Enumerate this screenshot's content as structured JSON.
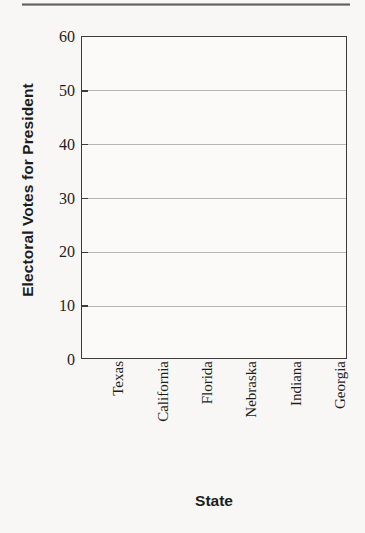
{
  "chart_data": {
    "type": "bar",
    "title": "",
    "subtitle": "",
    "xlabel": "State",
    "ylabel": "Electoral Votes for President",
    "categories": [
      "Texas",
      "California",
      "Florida",
      "Nebraska",
      "Indiana",
      "Georgia"
    ],
    "values": [
      null,
      null,
      null,
      null,
      null,
      null
    ],
    "series": [
      {
        "name": "Electoral Votes for President",
        "values": [
          null,
          null,
          null,
          null,
          null,
          null
        ]
      }
    ],
    "ylim": [
      0,
      60
    ],
    "ytick_labels": [
      "0",
      "10",
      "20",
      "30",
      "40",
      "50",
      "60"
    ],
    "ytick_values": [
      0,
      10,
      20,
      30,
      40,
      50,
      60
    ],
    "ytick_interval": 10,
    "grid": true,
    "grid_axis": "y",
    "legend": false,
    "legend_position": "none",
    "annotations": [],
    "note": "Blank plotting template: axes, gridlines and labels are drawn but no bars are plotted.",
    "colors": {
      "axis": "#3b3b3b",
      "gridline": "#9a9a9a",
      "text": "#1e1e1e",
      "title_text": "#1d1d1d",
      "plot_background": "#fbfaf8",
      "page_background": "#f8f7f5"
    }
  }
}
